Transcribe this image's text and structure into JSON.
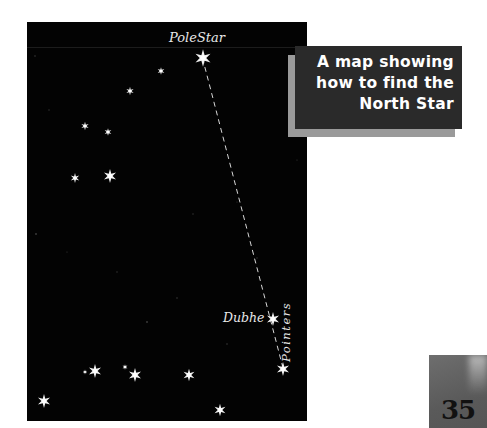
{
  "caption": {
    "lines": [
      "A map showing",
      "how to find the",
      "North Star"
    ]
  },
  "map": {
    "labels": {
      "pole_star": "PoleStar",
      "dubhe": "Dubhe",
      "pointers": "Pointers"
    },
    "colors": {
      "background": "#030303",
      "star": "#f2f2f2",
      "caption_bg": "#2a2a2a",
      "caption_shadow": "#9a9a9a"
    }
  },
  "page": {
    "number": "35"
  }
}
